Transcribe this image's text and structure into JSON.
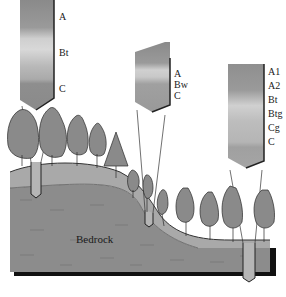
{
  "diagram": {
    "type": "soil catena cross-section",
    "ground_label": "Bedrock",
    "profiles": [
      {
        "position": "upslope (hilltop)",
        "horizons": [
          "A",
          "Bt",
          "C"
        ]
      },
      {
        "position": "midslope",
        "horizons": [
          "A",
          "Bw",
          "C"
        ]
      },
      {
        "position": "downslope (toeslope)",
        "horizons": [
          "A1",
          "A2",
          "Bt",
          "Btg",
          "Cg",
          "C"
        ]
      }
    ],
    "colors": {
      "soil_surface": "#a9a9a9",
      "bedrock": "#8c8c8c",
      "edge_shadow": "#111111",
      "profile_dark": "#7a7a7a",
      "profile_light": "#c8c8c8"
    }
  }
}
